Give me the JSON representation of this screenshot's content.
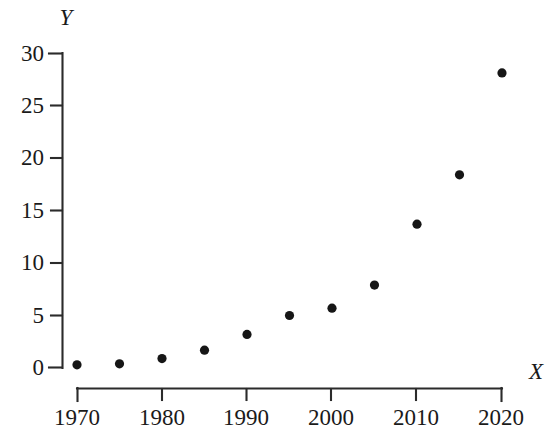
{
  "chart_data": {
    "type": "scatter",
    "title": "",
    "subtitle": "",
    "xlabel": "X",
    "ylabel": "Y",
    "x": [
      1970,
      1975,
      1980,
      1985,
      1990,
      1995,
      2000,
      2005,
      2010,
      2015,
      2020
    ],
    "values": [
      0.3,
      0.4,
      0.9,
      1.7,
      3.2,
      5.0,
      5.7,
      7.9,
      13.7,
      18.4,
      28.1
    ],
    "series": [
      {
        "name": "",
        "values": [
          0.3,
          0.4,
          0.9,
          1.7,
          3.2,
          5.0,
          5.7,
          7.9,
          13.7,
          18.4,
          28.1
        ]
      }
    ],
    "xlim": [
      1970,
      2020
    ],
    "ylim": [
      0,
      30
    ],
    "x_tick_labels": [
      "1970",
      "1980",
      "1990",
      "2000",
      "2010",
      "2020"
    ],
    "x_tick_values": [
      1970,
      1980,
      1990,
      2000,
      2010,
      2020
    ],
    "x_minor_tick_values": [
      1975,
      1985,
      1995,
      2005,
      2015
    ],
    "y_tick_labels": [
      "0",
      "5",
      "10",
      "15",
      "20",
      "25",
      "30"
    ],
    "y_tick_values": [
      0,
      5,
      10,
      15,
      20,
      25,
      30
    ],
    "grid": false,
    "legend": "none",
    "marker": "filled-circle",
    "marker_color": "#161616",
    "axis_color": "#2b2b2b",
    "background_color": "#ffffff",
    "annotations": []
  },
  "labels": {
    "y_axis_title": "Y",
    "x_axis_title": "X",
    "y_ticks": [
      "30",
      "25",
      "20",
      "15",
      "10",
      "5",
      "0"
    ],
    "x_ticks": [
      "1970",
      "1980",
      "1990",
      "2000",
      "2010",
      "2020"
    ]
  }
}
